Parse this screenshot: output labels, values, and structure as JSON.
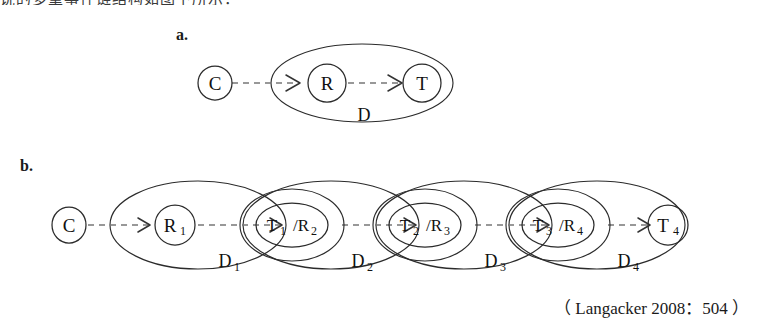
{
  "figure": {
    "cut_top_text": "说的多重事件链结构如图下所示：",
    "citation": "（ Langacker 2008：504 ）",
    "panel_a_label": "a.",
    "panel_b_label": "b.",
    "colors": {
      "stroke": "#2b2b2b",
      "dashed_link": "#777777",
      "text": "#111111",
      "background": "#ffffff"
    }
  },
  "panel_a": {
    "label": "a.",
    "nodes": [
      {
        "id": "c",
        "label": "C",
        "shape": "circle",
        "inside_domain": false
      },
      {
        "id": "r",
        "label": "R",
        "shape": "circle",
        "inside_domain": true
      },
      {
        "id": "t",
        "label": "T",
        "shape": "circle",
        "inside_domain": true
      }
    ],
    "domains": [
      {
        "id": "d",
        "label": "D"
      }
    ],
    "links": [
      {
        "from": "c",
        "to": "r",
        "style": "dashed-arrow"
      },
      {
        "from": "r",
        "to": "t",
        "style": "dashed-arrow"
      }
    ]
  },
  "panel_b": {
    "label": "b.",
    "nodes": [
      {
        "id": "c",
        "label": "C",
        "sub": "",
        "shape": "circle"
      },
      {
        "id": "r1",
        "label": "R",
        "sub": "1",
        "shape": "circle"
      },
      {
        "id": "t1r2",
        "label": "T",
        "sub": "1",
        "label2": "/R",
        "sub2": "2",
        "shape": "ellipse"
      },
      {
        "id": "t2r3",
        "label": "T",
        "sub": "2",
        "label2": "/R",
        "sub2": "3",
        "shape": "ellipse"
      },
      {
        "id": "t3r4",
        "label": "T",
        "sub": "3",
        "label2": "/R",
        "sub2": "4",
        "shape": "ellipse"
      },
      {
        "id": "t4",
        "label": "T",
        "sub": "4",
        "shape": "circle"
      }
    ],
    "domains": [
      {
        "id": "d1",
        "label": "D",
        "sub": "1"
      },
      {
        "id": "d2",
        "label": "D",
        "sub": "2"
      },
      {
        "id": "d3",
        "label": "D",
        "sub": "3"
      },
      {
        "id": "d4",
        "label": "D",
        "sub": "4"
      }
    ],
    "links": [
      {
        "from": "c",
        "to": "r1",
        "style": "dashed-arrow"
      },
      {
        "from": "r1",
        "to": "t1r2",
        "style": "dashed-arrow"
      },
      {
        "from": "t1r2",
        "to": "t2r3",
        "style": "dashed-arrow"
      },
      {
        "from": "t2r3",
        "to": "t3r4",
        "style": "dashed-arrow"
      },
      {
        "from": "t3r4",
        "to": "t4",
        "style": "dashed-arrow"
      }
    ]
  }
}
